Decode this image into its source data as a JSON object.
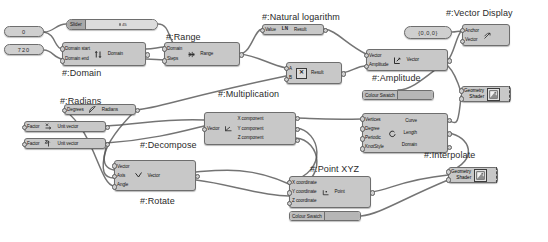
{
  "app": {
    "kind": "node-graph-canvas",
    "background": "#ffffff",
    "node_fill": "#c8c8c8",
    "node_border": "#6e6e6e",
    "wire_color": "#555555"
  },
  "captions": [
    {
      "name": "caption-domain",
      "text": "#:Domain",
      "x": 62,
      "y": 68
    },
    {
      "name": "caption-range",
      "text": "#:Range",
      "x": 166,
      "y": 32
    },
    {
      "name": "caption-natural-log",
      "text": "#:Natural logarithm",
      "x": 262,
      "y": 12
    },
    {
      "name": "caption-vector-display",
      "text": "#:Vector Display",
      "x": 446,
      "y": 8
    },
    {
      "name": "caption-amplitude",
      "text": "#:Amplitude",
      "x": 372,
      "y": 73
    },
    {
      "name": "caption-multiplication",
      "text": "#:Multiplication",
      "x": 218,
      "y": 89
    },
    {
      "name": "caption-radians",
      "text": "#:Radians",
      "x": 60,
      "y": 96
    },
    {
      "name": "caption-decompose",
      "text": "#:Decompose",
      "x": 140,
      "y": 140
    },
    {
      "name": "caption-interpolate",
      "text": "#:Interpolate",
      "x": 424,
      "y": 150
    },
    {
      "name": "caption-point-xyz",
      "text": "#:Point XYZ",
      "x": 310,
      "y": 164
    },
    {
      "name": "caption-rotate",
      "text": "#:Rotate",
      "x": 140,
      "y": 196
    }
  ],
  "number_params": [
    {
      "name": "number-param-0",
      "value": "0",
      "x": 4,
      "y": 26,
      "w": 40,
      "h": 11
    },
    {
      "name": "number-param-720",
      "value": "720",
      "x": 4,
      "y": 44,
      "w": 40,
      "h": 11
    }
  ],
  "vector_param": {
    "name": "vector-param-origin",
    "value": "{0,0,0}",
    "x": 404,
    "y": 26,
    "w": 48,
    "h": 13
  },
  "slider": {
    "name": "slider-node",
    "label": "Slider",
    "value": "45",
    "x": 66,
    "y": 19,
    "w": 92,
    "h": 11
  },
  "colour_swatches": [
    {
      "name": "colour-swatch-upper",
      "label": "Colour Swatch",
      "x": 362,
      "y": 90,
      "w": 72,
      "h": 10,
      "colour": "#b6b6b6"
    },
    {
      "name": "colour-swatch-lower",
      "label": "Colour Swatch",
      "x": 289,
      "y": 211,
      "w": 72,
      "h": 10,
      "colour": "#b6b6b6"
    }
  ],
  "nodes": [
    {
      "name": "node-domain",
      "title": "Domain",
      "glyph": "domain-icon",
      "inputs": [
        "Domain start",
        "Domain end"
      ],
      "outputs": [
        "Domain"
      ],
      "x": 62,
      "y": 42,
      "w": 84,
      "h": 24
    },
    {
      "name": "node-range",
      "title": "Range",
      "glyph": "range-icon",
      "inputs": [
        "Domain",
        "Steps"
      ],
      "outputs": [
        "Range"
      ],
      "x": 164,
      "y": 42,
      "w": 76,
      "h": 24
    },
    {
      "name": "node-natural-logarithm",
      "title": "Natural logarithm",
      "glyph": "ln-icon",
      "inputs": [
        "Value"
      ],
      "outputs": [
        "Result"
      ],
      "x": 262,
      "y": 24,
      "w": 62,
      "h": 11
    },
    {
      "name": "node-vector-display",
      "title": "Vector Display",
      "glyph": "vector-display-icon",
      "inputs": [
        "Anchor",
        "Vector"
      ],
      "outputs": [],
      "x": 462,
      "y": 24,
      "w": 48,
      "h": 22
    },
    {
      "name": "node-multiplication",
      "title": "Multiplication",
      "glyph": "multiply-icon",
      "inputs": [
        "A",
        "B"
      ],
      "outputs": [
        "Result"
      ],
      "x": 286,
      "y": 62,
      "w": 56,
      "h": 22
    },
    {
      "name": "node-amplitude",
      "title": "Amplitude",
      "glyph": "amplitude-icon",
      "inputs": [
        "Vector",
        "Amplitude"
      ],
      "outputs": [
        "Vector"
      ],
      "x": 366,
      "y": 49,
      "w": 82,
      "h": 22
    },
    {
      "name": "node-radians",
      "title": "Radians",
      "glyph": "radians-icon",
      "inputs": [
        "Degrees"
      ],
      "outputs": [
        "Radians"
      ],
      "x": 64,
      "y": 104,
      "w": 72,
      "h": 11
    },
    {
      "name": "node-unit-vector-x",
      "title": "Unit vector X",
      "glyph": "unit-x-icon",
      "inputs": [
        "Factor"
      ],
      "outputs": [
        "Unit vector"
      ],
      "x": 24,
      "y": 121,
      "w": 82,
      "h": 11
    },
    {
      "name": "node-unit-vector-z",
      "title": "Unit vector Z",
      "glyph": "unit-z-icon",
      "inputs": [
        "Factor"
      ],
      "outputs": [
        "Unit vector"
      ],
      "x": 24,
      "y": 138,
      "w": 82,
      "h": 11
    },
    {
      "name": "node-decompose",
      "title": "Decompose",
      "glyph": "decompose-icon",
      "inputs": [
        "Vector"
      ],
      "outputs": [
        "X component",
        "Y component",
        "Z component"
      ],
      "x": 204,
      "y": 112,
      "w": 92,
      "h": 33
    },
    {
      "name": "node-rotate",
      "title": "Rotate",
      "glyph": "rotate-icon",
      "inputs": [
        "Vector",
        "Axis",
        "Angle"
      ],
      "outputs": [
        "Vector"
      ],
      "x": 114,
      "y": 160,
      "w": 82,
      "h": 31
    },
    {
      "name": "node-point-xyz",
      "title": "Point XYZ",
      "glyph": "point-xyz-icon",
      "inputs": [
        "X coordinate",
        "Y coordinate",
        "Z coordinate"
      ],
      "outputs": [
        "Point"
      ],
      "x": 289,
      "y": 176,
      "w": 82,
      "h": 32
    },
    {
      "name": "node-interpolate",
      "title": "Interpolate",
      "glyph": "interpolate-icon",
      "inputs": [
        "Vertices",
        "Degree",
        "Periodic",
        "KnotStyle"
      ],
      "outputs": [
        "Curve",
        "Length",
        "Domain"
      ],
      "x": 362,
      "y": 113,
      "w": 86,
      "h": 40
    }
  ],
  "previews": [
    {
      "name": "preview-geometry-shader-upper",
      "inputs": [
        "Geometry",
        "Shader"
      ],
      "icon": "shader-preview-icon",
      "x": 461,
      "y": 86,
      "w": 50,
      "h": 16
    },
    {
      "name": "preview-geometry-shader-lower",
      "inputs": [
        "Geometry",
        "Shader"
      ],
      "icon": "shader-preview-icon",
      "x": 448,
      "y": 167,
      "w": 50,
      "h": 16
    }
  ],
  "wires": [
    "M44,32 C54,32 56,24 66,24",
    "M44,32 C56,34 54,48 62,49",
    "M44,50 C52,50 54,58 62,59",
    "M158,24 C170,24 168,40 176,47",
    "M146,49 C154,49 158,47 164,47",
    "M146,59 C154,59 158,60 164,60",
    "M240,54 C252,52 254,30 262,29",
    "M240,54 C258,56 268,64 286,68",
    "M324,29 C336,30 346,44 366,54",
    "M342,73 C352,72 356,66 366,66",
    "M398,90 C412,90 424,78 448,60",
    "M448,60 C454,54 456,36 462,30",
    "M452,32 C456,32 458,31 462,31",
    "M448,66 C452,70 456,76 461,92",
    "M136,110 C160,108 180,98 286,76",
    "M106,126 C140,124 170,118 204,120",
    "M106,143 C150,140 180,132 204,126",
    "M296,118 C310,118 320,120 362,119",
    "M296,128 C320,130 330,172 289,182",
    "M296,138 C320,140 330,180 289,192",
    "M196,172 C220,170 250,166 289,184",
    "M196,180 C230,184 260,196 289,196",
    "M114,170 C100,168 96,150 136,110",
    "M114,178 C104,178 100,172 106,148",
    "M114,186 C100,186 94,130 64,110",
    "M371,192 C390,190 400,180 448,175",
    "M448,121 C456,122 458,130 461,96",
    "M448,133 C470,136 480,160 448,172",
    "M361,216 C380,214 400,200 448,180"
  ]
}
